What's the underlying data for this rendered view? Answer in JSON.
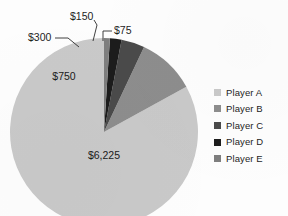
{
  "chart_data": {
    "type": "pie",
    "title": "",
    "categories": [
      "Player A",
      "Player B",
      "Player C",
      "Player D",
      "Player E"
    ],
    "values": [
      6225,
      750,
      300,
      150,
      75
    ],
    "value_labels": [
      "$6,225",
      "$750",
      "$300",
      "$150",
      "$75"
    ],
    "total": 7500,
    "legend_position": "right",
    "grid": false,
    "colors": {
      "player_a": "#c9c9c9",
      "player_b": "#8d8d8d",
      "player_c": "#4a4a4a",
      "player_d": "#1c1c1c",
      "player_e": "#7e7e7e"
    },
    "slices": [
      {
        "name": "Player A",
        "label": "$6,225",
        "value": 6225,
        "color": "#c9c9c9",
        "label_placement": "inside",
        "label_x": 104,
        "label_y": 156
      },
      {
        "name": "Player B",
        "label": "$750",
        "value": 750,
        "color": "#8d8d8d",
        "label_placement": "inside",
        "label_x": 64,
        "label_y": 77
      },
      {
        "name": "Player C",
        "label": "$300",
        "value": 300,
        "color": "#4a4a4a",
        "label_placement": "outside",
        "label_x": 28,
        "label_y": 38,
        "leader": "M 55 38 L 68 38 L 79 47"
      },
      {
        "name": "Player D",
        "label": "$150",
        "value": 150,
        "color": "#1c1c1c",
        "label_placement": "outside",
        "label_x": 70,
        "label_y": 17,
        "leader": "M 94 20 L 97 25 L 93 41"
      },
      {
        "name": "Player E",
        "label": "$75",
        "value": 75,
        "color": "#7e7e7e",
        "label_placement": "outside",
        "label_x": 114,
        "label_y": 31,
        "leader": "M 112 31 L 103 31 L 103 41"
      }
    ]
  },
  "legend": {
    "items": [
      {
        "label": "Player A",
        "color": "#c9c9c9"
      },
      {
        "label": "Player B",
        "color": "#8d8d8d"
      },
      {
        "label": "Player C",
        "color": "#4a4a4a"
      },
      {
        "label": "Player D",
        "color": "#1c1c1c"
      },
      {
        "label": "Player E",
        "color": "#7e7e7e"
      }
    ]
  },
  "pie_geometry": {
    "cx": 104,
    "cy": 132,
    "r": 94,
    "start_angle_deg": -90,
    "direction": "counterclockwise"
  }
}
